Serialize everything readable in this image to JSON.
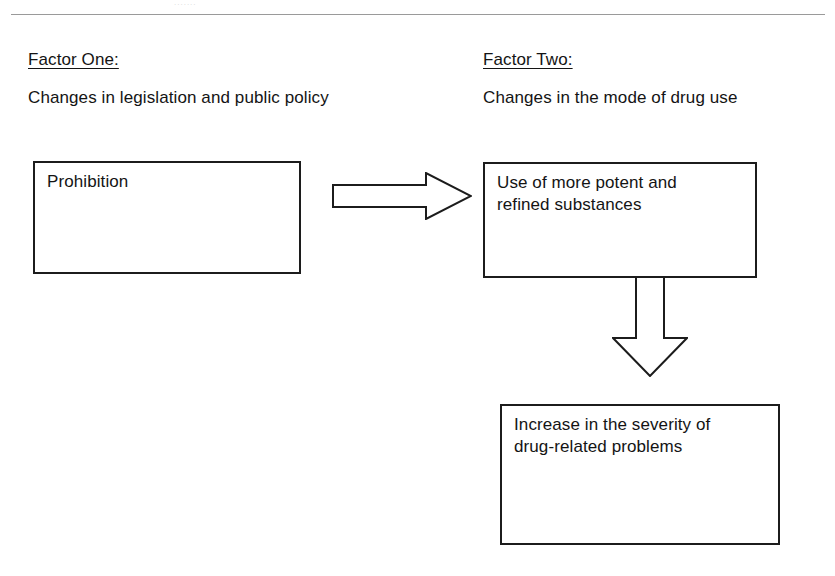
{
  "page": {
    "width": 835,
    "height": 576,
    "background": "#ffffff",
    "ink_color": "#141414",
    "rule_color": "#9a9a9a",
    "border_color": "#1c1c1c",
    "faint_running_head": "......."
  },
  "columns": {
    "left": {
      "heading": "Factor One:",
      "subtitle": "Changes in legislation and public policy"
    },
    "right": {
      "heading": "Factor Two:",
      "subtitle": "Changes in the mode of drug use"
    }
  },
  "boxes": [
    {
      "id": "prohibition",
      "text": "Prohibition",
      "x": 33,
      "y": 161,
      "w": 268,
      "h": 113
    },
    {
      "id": "potent-substances",
      "text": "Use of more potent and\nrefined substances",
      "x": 483,
      "y": 162,
      "w": 274,
      "h": 116
    },
    {
      "id": "severity-problems",
      "text": "Increase in the severity of\ndrug-related problems",
      "x": 500,
      "y": 404,
      "w": 280,
      "h": 141
    }
  ],
  "arrows": [
    {
      "id": "horizontal-arrow",
      "direction": "right",
      "from": "prohibition",
      "to": "potent-substances",
      "x": 332,
      "y": 172,
      "w": 140,
      "h": 48
    },
    {
      "id": "vertical-arrow",
      "direction": "down",
      "from": "potent-substances",
      "to": "severity-problems",
      "x": 612,
      "y": 277,
      "w": 76,
      "h": 100
    }
  ]
}
